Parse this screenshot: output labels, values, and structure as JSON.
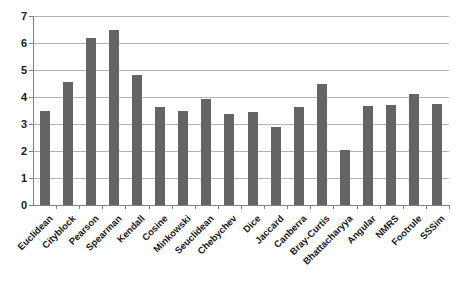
{
  "chart_data": {
    "type": "bar",
    "title": "",
    "subtitle": "",
    "xlabel": "",
    "ylabel": "",
    "ylim": [
      0,
      7
    ],
    "ytick_interval": 1,
    "yticks": [
      "0",
      "1",
      "2",
      "3",
      "4",
      "5",
      "6",
      "7"
    ],
    "grid": true,
    "grid_axis": "y",
    "legend": false,
    "legend_position": "none",
    "bar_color": "#646464",
    "plot_background": "#ffffff",
    "gridline_color": "#b3b3b3",
    "axis_color": "#808080",
    "categories": [
      "Euclidean",
      "Cityblock",
      "Pearson",
      "Spearman",
      "Kendall",
      "Cosine",
      "Minkowski",
      "Seuclidean",
      "Chebychev",
      "Dice",
      "Jaccard",
      "Canberra",
      "Bray-Curtis",
      "Bhattacharyya",
      "Angular",
      "NMRS",
      "Footrule",
      "SSSim"
    ],
    "values": [
      3.5,
      4.55,
      6.2,
      6.5,
      4.82,
      3.62,
      3.47,
      3.93,
      3.37,
      3.45,
      2.9,
      3.62,
      4.48,
      2.05,
      3.68,
      3.7,
      4.1,
      3.75
    ],
    "series": [
      {
        "name": "",
        "values": [
          3.5,
          4.55,
          6.2,
          6.5,
          4.82,
          3.62,
          3.47,
          3.93,
          3.37,
          3.45,
          2.9,
          3.62,
          4.48,
          2.05,
          3.68,
          3.7,
          4.1,
          3.75
        ]
      }
    ]
  }
}
